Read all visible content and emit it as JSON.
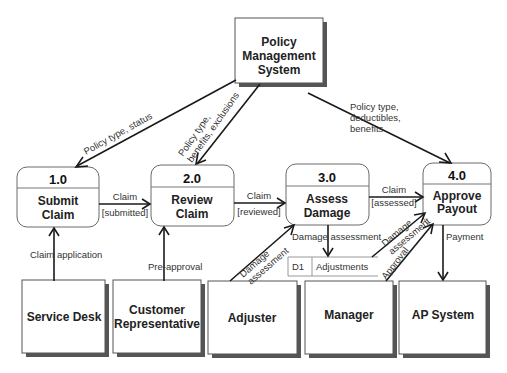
{
  "diagram": {
    "type": "data-flow-diagram",
    "external_entities": [
      {
        "id": "pms",
        "label_lines": [
          "Policy",
          "Management",
          "System"
        ]
      },
      {
        "id": "service_desk",
        "label_lines": [
          "Service Desk"
        ]
      },
      {
        "id": "customer_rep",
        "label_lines": [
          "Customer",
          "Representative"
        ]
      },
      {
        "id": "adjuster",
        "label_lines": [
          "Adjuster"
        ]
      },
      {
        "id": "manager",
        "label_lines": [
          "Manager"
        ]
      },
      {
        "id": "ap_system",
        "label_lines": [
          "AP System"
        ]
      }
    ],
    "processes": [
      {
        "id": "p1",
        "number": "1.0",
        "name_lines": [
          "Submit",
          "Claim"
        ]
      },
      {
        "id": "p2",
        "number": "2.0",
        "name_lines": [
          "Review",
          "Claim"
        ]
      },
      {
        "id": "p3",
        "number": "3.0",
        "name_lines": [
          "Assess",
          "Damage"
        ]
      },
      {
        "id": "p4",
        "number": "4.0",
        "name_lines": [
          "Approve",
          "Payout"
        ]
      }
    ],
    "data_stores": [
      {
        "id": "d1",
        "code": "D1",
        "name": "Adjustments"
      }
    ],
    "flows": [
      {
        "from": "pms",
        "to": "p1",
        "label_lines": [
          "Policy type, status"
        ]
      },
      {
        "from": "pms",
        "to": "p2",
        "label_lines": [
          "Policy type,",
          "benefits, exclusions"
        ]
      },
      {
        "from": "pms",
        "to": "p4",
        "label_lines": [
          "Policy type,",
          "deductibles,",
          "benefits"
        ]
      },
      {
        "from": "p1",
        "to": "p2",
        "label_lines": [
          "Claim",
          "[submitted]"
        ]
      },
      {
        "from": "p2",
        "to": "p3",
        "label_lines": [
          "Claim",
          "[reviewed]"
        ]
      },
      {
        "from": "p3",
        "to": "p4",
        "label_lines": [
          "Claim",
          "[assessed]"
        ]
      },
      {
        "from": "service_desk",
        "to": "p1",
        "label_lines": [
          "Claim application"
        ]
      },
      {
        "from": "customer_rep",
        "to": "p2",
        "label_lines": [
          "Pre-approval"
        ]
      },
      {
        "from": "adjuster",
        "to": "p3",
        "label_lines": [
          "Damage",
          "assessment"
        ]
      },
      {
        "from": "p3",
        "to": "d1",
        "label_lines": [
          "Damage assessment"
        ]
      },
      {
        "from": "d1",
        "to": "p4",
        "label_lines": [
          "Damage",
          "assessment"
        ]
      },
      {
        "from": "manager",
        "to": "p4",
        "label_lines": [
          "Approval"
        ]
      },
      {
        "from": "p4",
        "to": "ap_system",
        "label_lines": [
          "Payment"
        ]
      }
    ]
  },
  "t": {
    "pms1": "Policy",
    "pms2": "Management",
    "pms3": "System",
    "sd": "Service Desk",
    "cr1": "Customer",
    "cr2": "Representative",
    "adj": "Adjuster",
    "mgr": "Manager",
    "ap": "AP System",
    "p1n": "1.0",
    "p1a": "Submit",
    "p1b": "Claim",
    "p2n": "2.0",
    "p2a": "Review",
    "p2b": "Claim",
    "p3n": "3.0",
    "p3a": "Assess",
    "p3b": "Damage",
    "p4n": "4.0",
    "p4a": "Approve",
    "p4b": "Payout",
    "d1code": "D1",
    "d1name": "Adjustments",
    "f_pms_p1": "Policy type, status",
    "f_pms_p2a": "Policy type,",
    "f_pms_p2b": "benefits, exclusions",
    "f_pms_p4a": "Policy type,",
    "f_pms_p4b": "deductibles,",
    "f_pms_p4c": "benefits",
    "f_12a": "Claim",
    "f_12b": "[submitted]",
    "f_23a": "Claim",
    "f_23b": "[reviewed]",
    "f_34a": "Claim",
    "f_34b": "[assessed]",
    "f_sd": "Claim application",
    "f_cr": "Pre-approval",
    "f_adj_a": "Damage",
    "f_adj_b": "assessment",
    "f_3d1": "Damage assessment",
    "f_d14a": "Damage",
    "f_d14b": "assessment",
    "f_mgr": "Approval",
    "f_pay": "Payment"
  }
}
